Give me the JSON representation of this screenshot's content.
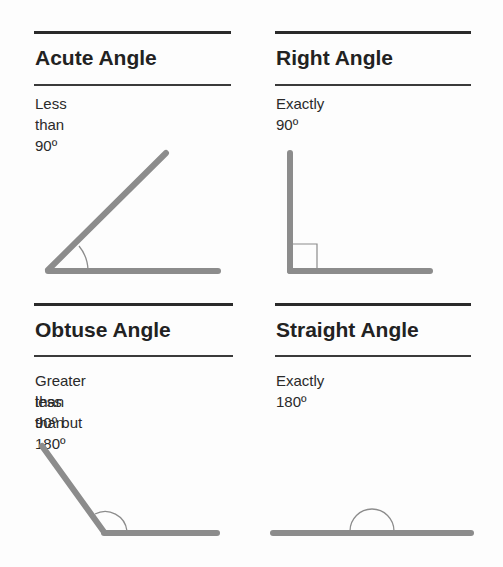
{
  "panels": [
    {
      "id": "acute",
      "title": "Acute Angle",
      "description_lines": [
        "Less than 90",
        "º"
      ],
      "description": "Less than 90º"
    },
    {
      "id": "right",
      "title": "Right Angle",
      "description": "Exactly 90º"
    },
    {
      "id": "obtuse",
      "title": "Obtuse Angle",
      "description_line1": "Greater than 90º but",
      "description_line2": "less than 180º"
    },
    {
      "id": "straight",
      "title": "Straight Angle",
      "description": "Exactly 180º"
    }
  ],
  "colors": {
    "ray": "#8a8a8a",
    "arc": "#8a8a8a",
    "rule": "#2a2a2a",
    "text": "#222222"
  }
}
